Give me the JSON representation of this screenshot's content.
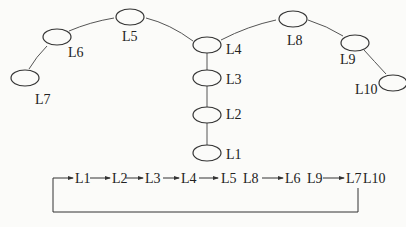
{
  "diagram": {
    "nodes": [
      {
        "id": "L1",
        "label": "L1",
        "cx": 207,
        "cy": 153,
        "lx": 226,
        "ly": 148
      },
      {
        "id": "L2",
        "label": "L2",
        "cx": 207,
        "cy": 115,
        "lx": 226,
        "ly": 108
      },
      {
        "id": "L3",
        "label": "L3",
        "cx": 207,
        "cy": 78,
        "lx": 226,
        "ly": 73
      },
      {
        "id": "L4",
        "label": "L4",
        "cx": 207,
        "cy": 45,
        "lx": 226,
        "ly": 43
      },
      {
        "id": "L5",
        "label": "L5",
        "cx": 130,
        "cy": 17,
        "lx": 122,
        "ly": 30
      },
      {
        "id": "L6",
        "label": "L6",
        "cx": 57,
        "cy": 37,
        "lx": 68,
        "ly": 46
      },
      {
        "id": "L7",
        "label": "L7",
        "cx": 25,
        "cy": 78,
        "lx": 35,
        "ly": 93
      },
      {
        "id": "L8",
        "label": "L8",
        "cx": 293,
        "cy": 19,
        "lx": 287,
        "ly": 34
      },
      {
        "id": "L9",
        "label": "L9",
        "cx": 355,
        "cy": 43,
        "lx": 340,
        "ly": 53
      },
      {
        "id": "L10",
        "label": "L10",
        "cx": 393,
        "cy": 83,
        "lx": 355,
        "ly": 83
      }
    ],
    "edges": [
      [
        "L1",
        "L2"
      ],
      [
        "L2",
        "L3"
      ],
      [
        "L3",
        "L4"
      ],
      [
        "L4",
        "L5"
      ],
      [
        "L5",
        "L6"
      ],
      [
        "L6",
        "L7"
      ],
      [
        "L4",
        "L8"
      ],
      [
        "L8",
        "L9"
      ],
      [
        "L9",
        "L10"
      ]
    ],
    "sequence": {
      "items": [
        {
          "text": "L1",
          "x": 75
        },
        {
          "text": "L2",
          "x": 112
        },
        {
          "text": "L3",
          "x": 145
        },
        {
          "text": "L4",
          "x": 181
        },
        {
          "text": "L5",
          "x": 221
        },
        {
          "text": "L8",
          "x": 243
        },
        {
          "text": "L6",
          "x": 285
        },
        {
          "text": "L9",
          "x": 307
        },
        {
          "text": "L7",
          "x": 346
        },
        {
          "text": "L10",
          "x": 363
        }
      ],
      "arrows": [
        {
          "from": "L1",
          "to": "L2"
        },
        {
          "from": "L2",
          "to": "L3"
        },
        {
          "from": "L3",
          "to": "L4"
        },
        {
          "from": "L4",
          "to": "L5 L8"
        },
        {
          "from": "L5 L8",
          "to": "L6 L9"
        },
        {
          "from": "L6 L9",
          "to": "L7 L10"
        },
        {
          "from": "L7 L10",
          "to": "L1",
          "type": "feedback-loop"
        }
      ]
    }
  }
}
